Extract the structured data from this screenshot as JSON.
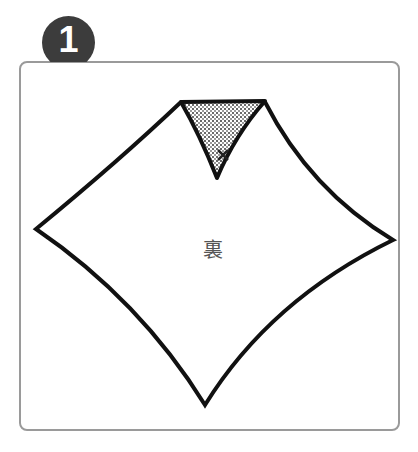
{
  "step": {
    "number": "1",
    "badge_color": "#3c3c3c"
  },
  "diagram": {
    "center_label": "裏",
    "outline_color": "#111111",
    "fold_fill": "dotted-grey"
  },
  "frame": {
    "border_color": "#9a9a9a"
  }
}
